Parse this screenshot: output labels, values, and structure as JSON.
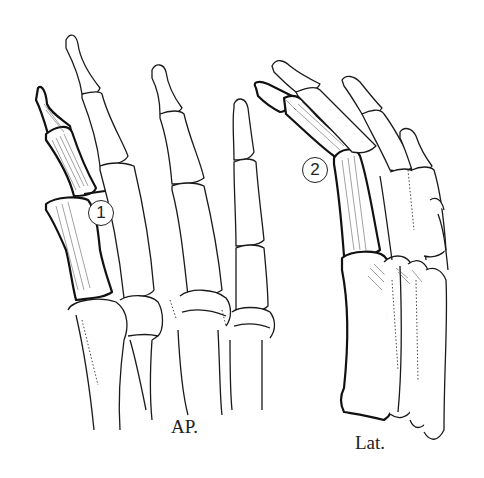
{
  "figure": {
    "views": [
      {
        "id": "ap",
        "label": "AP.",
        "description": "Anteroposterior view of forefoot bones"
      },
      {
        "id": "lat",
        "label": "Lat.",
        "description": "Lateral view of forefoot bones"
      }
    ],
    "markers": [
      {
        "number": "1",
        "view": "ap",
        "meaning": "fracture site at base of hallux proximal phalanx joint"
      },
      {
        "number": "2",
        "view": "lat",
        "meaning": "marked injury site on hallux in lateral view"
      }
    ],
    "colors": {
      "line": "#1a1a1a",
      "background": "#ffffff"
    }
  }
}
